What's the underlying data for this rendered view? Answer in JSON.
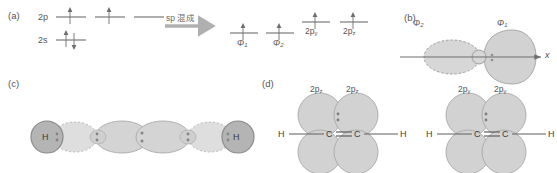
{
  "figure": {
    "panels": {
      "a": "(a)",
      "b": "(b)",
      "c": "(c)",
      "d": "(d)"
    }
  },
  "panel_a": {
    "levels": [
      {
        "name": "2p",
        "label": "2p"
      },
      {
        "name": "2s",
        "label": "2s"
      }
    ],
    "hybrid_labels": [
      "Φ",
      "Φ"
    ],
    "hybrid_subs": [
      "1",
      "2"
    ],
    "p_labels": [
      "2p",
      "2p"
    ],
    "p_subs": [
      "y",
      "z"
    ],
    "arrow_text": "sp 混成"
  },
  "panel_b": {
    "phi2": "Φ",
    "phi2_sub": "2",
    "phi1": "Φ",
    "phi1_sub": "1",
    "axis": "x"
  },
  "panel_c": {
    "h_left": "H",
    "h_right": "H"
  },
  "panel_d": {
    "left": {
      "orb_label_1": "2p",
      "orb_sub_1": "z",
      "orb_label_2": "2p",
      "orb_sub_2": "z",
      "h_left": "H",
      "h_right": "H",
      "c_left": "C",
      "c_right": "C"
    },
    "right": {
      "orb_label_1": "2p",
      "orb_sub_1": "y",
      "orb_label_2": "2p",
      "orb_sub_2": "y",
      "h_left": "H",
      "h_right": "H",
      "c_left": "C",
      "c_right": "C"
    }
  },
  "colors": {
    "line": "#6e6e6e",
    "orbital_fill": "#d2d2d2",
    "orbital_stroke": "#a8a8a8",
    "atom_fill": "#b4b4b4",
    "atom_stroke": "#8a8a8a",
    "text": "#4a4a4a",
    "arrow": "#b0b0b0"
  }
}
